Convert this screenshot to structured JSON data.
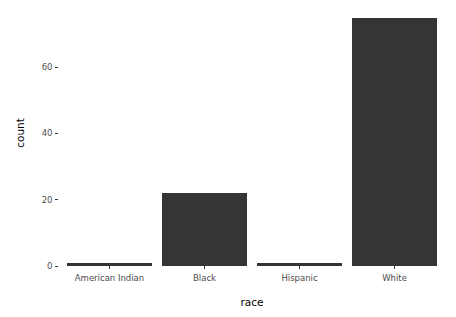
{
  "chart_data": {
    "type": "bar",
    "title": "",
    "subtitle": "",
    "xlabel": "race",
    "ylabel": "count",
    "categories": [
      "American Indian",
      "Black",
      "Hispanic",
      "White"
    ],
    "values": [
      1,
      22,
      1,
      75
    ],
    "series": [
      {
        "name": "count",
        "values": [
          1,
          22,
          1,
          75
        ]
      }
    ],
    "ylim": [
      0,
      78
    ],
    "yticks": [
      0,
      20,
      40,
      60
    ],
    "ytick_labels": [
      "0",
      "20",
      "40",
      "60"
    ],
    "xtick_labels": [
      "American Indian",
      "Black",
      "Hispanic",
      "White"
    ],
    "grid": false,
    "legend": false,
    "legend_position": "none",
    "bar_color": "#353535",
    "background_color": "#ffffff",
    "axis_text_color": "#4d4d4d",
    "axis_title_color": "#000000"
  }
}
